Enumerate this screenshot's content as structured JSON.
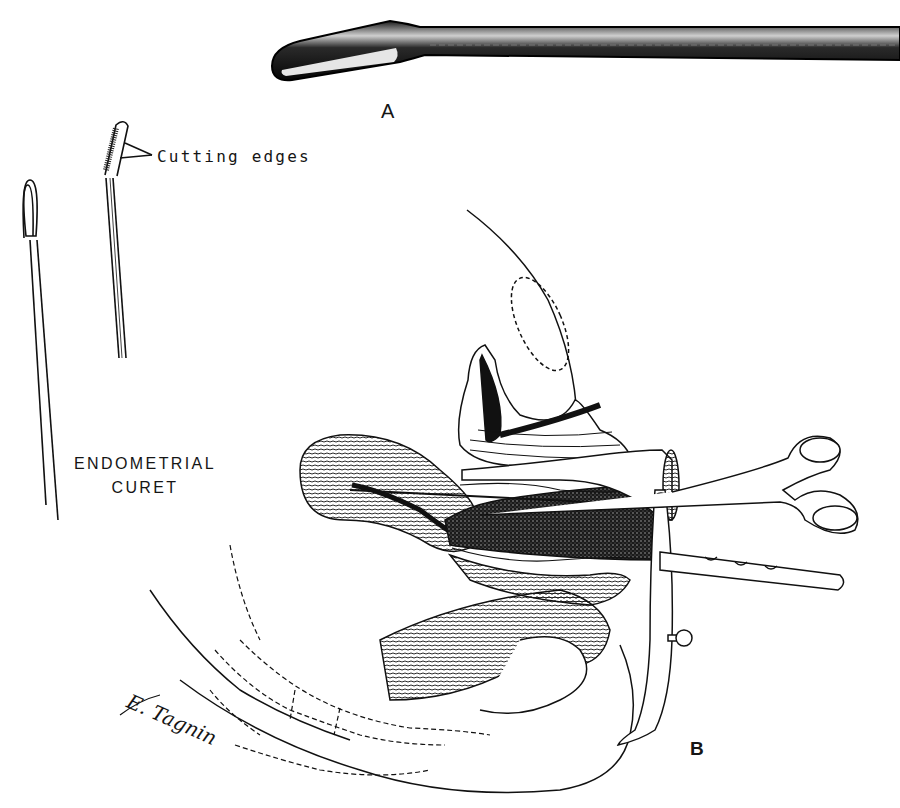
{
  "figure": {
    "panels": [
      {
        "id": "A",
        "label": "A",
        "description": "Close-up of curet tip (photograph)"
      },
      {
        "id": "B",
        "label": "B",
        "description": "Sagittal section showing endometrial curettage with speculum and tenaculum"
      }
    ],
    "annotations": {
      "cutting_edges": "Cutting edges",
      "instrument_name_line1": "ENDOMETRIAL",
      "instrument_name_line2": "CURET"
    },
    "signature": "E. Tagnin",
    "colors": {
      "ink": "#111111",
      "background": "#ffffff",
      "stipple": "#333333"
    }
  }
}
